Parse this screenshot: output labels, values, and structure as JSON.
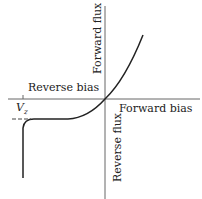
{
  "diagram": {
    "labels": {
      "forward_flux": "Forward flux",
      "reverse_flux": "Reverse flux",
      "reverse_bias": "Reverse bias",
      "forward_bias": "Forward bias",
      "vz": "V",
      "vz_sub": "z"
    },
    "colors": {
      "axis": "#555555",
      "curve": "#222222"
    }
  }
}
